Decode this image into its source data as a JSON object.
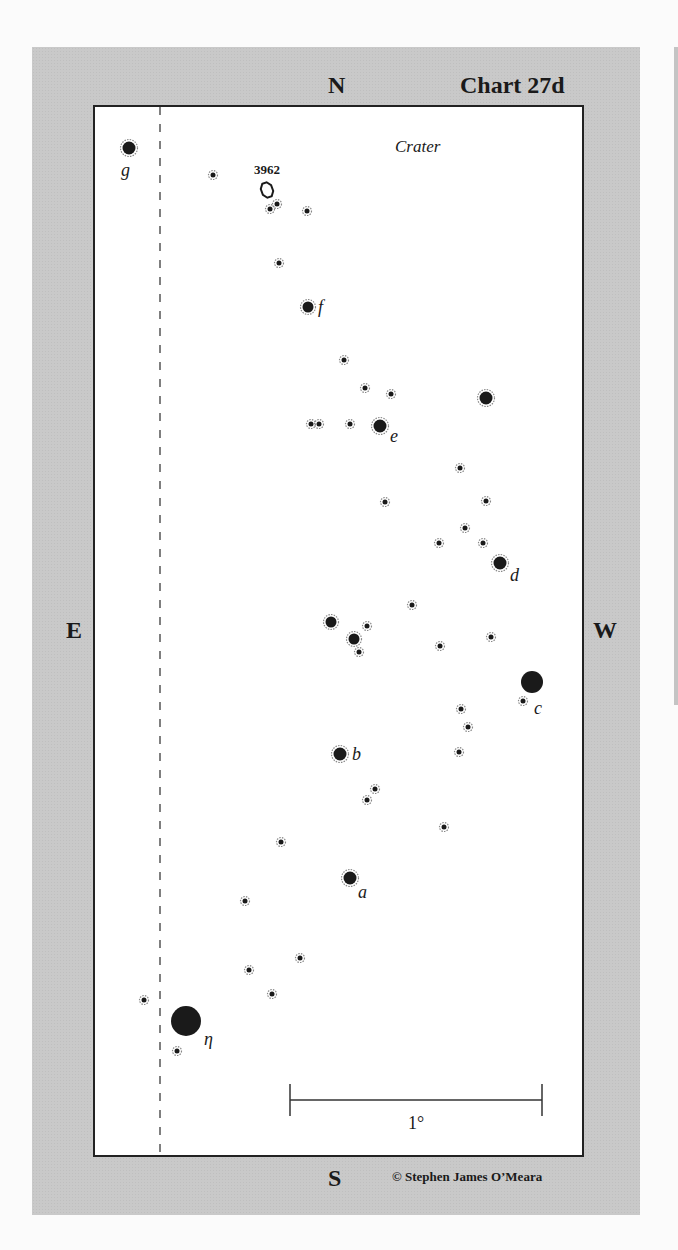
{
  "chart": {
    "title": "Chart 27d",
    "constellation": "Crater",
    "copyright": "© Stephen James O’Meara",
    "scale_label": "1°",
    "compass": {
      "north": "N",
      "south": "S",
      "east": "E",
      "west": "W"
    }
  },
  "chart_data": {
    "type": "scatter",
    "title": "Chart 27d",
    "subtitle": "Crater",
    "xlabel": "E — W",
    "ylabel": "S — N",
    "scale_bar": {
      "label": "1°",
      "x1": 290,
      "x2": 542,
      "y": 1100
    },
    "galaxies": [
      {
        "name": "3962",
        "x": 267,
        "y": 190
      }
    ],
    "labeled_stars": [
      {
        "label": "g",
        "x": 129,
        "y": 148,
        "r": 7
      },
      {
        "label": "f",
        "x": 308,
        "y": 307,
        "r": 6
      },
      {
        "label": "e",
        "x": 380,
        "y": 426,
        "r": 7
      },
      {
        "label": "d",
        "x": 500,
        "y": 563,
        "r": 7
      },
      {
        "label": "c",
        "x": 532,
        "y": 682,
        "r": 11
      },
      {
        "label": "b",
        "x": 340,
        "y": 754,
        "r": 7
      },
      {
        "label": "a",
        "x": 350,
        "y": 878,
        "r": 7
      },
      {
        "label": "η",
        "x": 186,
        "y": 1021,
        "r": 15
      }
    ],
    "unlabeled_stars": [
      {
        "x": 486,
        "y": 398,
        "r": 7
      },
      {
        "x": 331,
        "y": 622,
        "r": 6
      },
      {
        "x": 354,
        "y": 639,
        "r": 6
      },
      {
        "x": 213,
        "y": 175,
        "r": 3
      },
      {
        "x": 270,
        "y": 209,
        "r": 3
      },
      {
        "x": 277,
        "y": 204,
        "r": 3
      },
      {
        "x": 307,
        "y": 211,
        "r": 3
      },
      {
        "x": 279,
        "y": 263,
        "r": 3
      },
      {
        "x": 344,
        "y": 360,
        "r": 3
      },
      {
        "x": 365,
        "y": 388,
        "r": 3
      },
      {
        "x": 391,
        "y": 394,
        "r": 3
      },
      {
        "x": 311,
        "y": 424,
        "r": 3
      },
      {
        "x": 319,
        "y": 424,
        "r": 3
      },
      {
        "x": 350,
        "y": 424,
        "r": 3
      },
      {
        "x": 460,
        "y": 468,
        "r": 3
      },
      {
        "x": 385,
        "y": 502,
        "r": 3
      },
      {
        "x": 486,
        "y": 501,
        "r": 3
      },
      {
        "x": 465,
        "y": 528,
        "r": 3
      },
      {
        "x": 439,
        "y": 543,
        "r": 3
      },
      {
        "x": 483,
        "y": 543,
        "r": 3
      },
      {
        "x": 412,
        "y": 605,
        "r": 3
      },
      {
        "x": 367,
        "y": 626,
        "r": 3
      },
      {
        "x": 359,
        "y": 652,
        "r": 3
      },
      {
        "x": 440,
        "y": 646,
        "r": 3
      },
      {
        "x": 491,
        "y": 637,
        "r": 3
      },
      {
        "x": 523,
        "y": 701,
        "r": 3
      },
      {
        "x": 461,
        "y": 709,
        "r": 3
      },
      {
        "x": 468,
        "y": 727,
        "r": 3
      },
      {
        "x": 459,
        "y": 752,
        "r": 3
      },
      {
        "x": 375,
        "y": 789,
        "r": 3
      },
      {
        "x": 367,
        "y": 800,
        "r": 3
      },
      {
        "x": 444,
        "y": 827,
        "r": 3
      },
      {
        "x": 281,
        "y": 842,
        "r": 3
      },
      {
        "x": 245,
        "y": 901,
        "r": 3
      },
      {
        "x": 300,
        "y": 958,
        "r": 3
      },
      {
        "x": 249,
        "y": 970,
        "r": 3
      },
      {
        "x": 272,
        "y": 994,
        "r": 3
      },
      {
        "x": 144,
        "y": 1000,
        "r": 3
      },
      {
        "x": 177,
        "y": 1051,
        "r": 3
      }
    ],
    "dashed_line": {
      "x": 160,
      "y1": 107,
      "y2": 1153
    }
  },
  "colors": {
    "panel": "#c9c9c9",
    "chart_bg": "#ffffff",
    "ink": "#1a1a1a"
  }
}
